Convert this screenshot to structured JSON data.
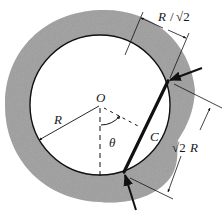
{
  "figure": {
    "type": "diagram",
    "colors": {
      "annulus_fill": "#9a9a9a",
      "line": "#111111",
      "background": "#ffffff"
    },
    "labels": {
      "center": "O",
      "radius": "R",
      "chord": "C",
      "angle": "θ",
      "dim_top_R": "R",
      "dim_top_sep": "/",
      "dim_top_sqrt": "√2",
      "dim_right_sqrt": "√2",
      "dim_right_R": "R"
    },
    "geometry": {
      "center": [
        100,
        105
      ],
      "inner_radius": 70,
      "outer_radius": 95,
      "chord_start": [
        168,
        81
      ],
      "chord_end": [
        124,
        172
      ]
    }
  }
}
